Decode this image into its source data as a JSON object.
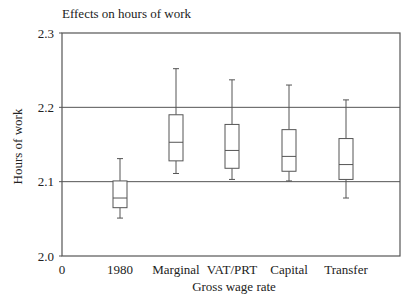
{
  "chart_data": {
    "type": "boxplot",
    "title": "Effects on hours of work",
    "xlabel": "Gross wage rate",
    "ylabel": "Hours of work",
    "ylim": [
      2.0,
      2.3
    ],
    "yticks": [
      2.0,
      2.1,
      2.2,
      2.3
    ],
    "ytick_labels": [
      "2.0",
      "2.1",
      "2.2",
      "2.3"
    ],
    "xtick_origin_label": "0",
    "gridlines_y": [
      2.1,
      2.2
    ],
    "grid": "horizontal at 2.1 and 2.2",
    "legend": null,
    "categories": [
      "1980",
      "Marginal",
      "VAT/PRT",
      "Capital",
      "Transfer"
    ],
    "series": [
      {
        "name": "1980",
        "whisker_low": 2.051,
        "q1": 2.065,
        "median": 2.078,
        "q3": 2.101,
        "whisker_high": 2.131
      },
      {
        "name": "Marginal",
        "whisker_low": 2.111,
        "q1": 2.128,
        "median": 2.153,
        "q3": 2.19,
        "whisker_high": 2.252
      },
      {
        "name": "VAT/PRT",
        "whisker_low": 2.103,
        "q1": 2.118,
        "median": 2.142,
        "q3": 2.177,
        "whisker_high": 2.237
      },
      {
        "name": "Capital",
        "whisker_low": 2.101,
        "q1": 2.114,
        "median": 2.134,
        "q3": 2.17,
        "whisker_high": 2.23
      },
      {
        "name": "Transfer",
        "whisker_low": 2.078,
        "q1": 2.103,
        "median": 2.123,
        "q3": 2.158,
        "whisker_high": 2.21
      }
    ]
  },
  "layout": {
    "plot_left": 62,
    "plot_right": 400,
    "plot_top": 33,
    "plot_bottom": 256,
    "box_centers": [
      120,
      176,
      232,
      289,
      346
    ],
    "box_width": 14,
    "cap_width": 8,
    "line_color": "#555555",
    "frame_color": "#555555"
  }
}
